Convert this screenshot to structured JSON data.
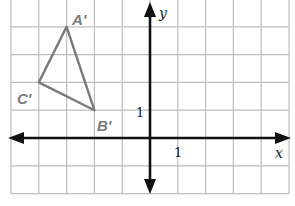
{
  "figure": {
    "type": "coordinate-grid",
    "grid": {
      "x_range": [
        -5,
        5
      ],
      "y_range": [
        -2,
        5
      ],
      "cell_px": 27.8,
      "origin_px": [
        150,
        138
      ],
      "grid_color": "#bdbdbd",
      "axis_color": "#111111"
    },
    "axes": {
      "x_label": "x",
      "y_label": "y",
      "x_tick_label": "1",
      "y_tick_label": "1"
    },
    "triangle": {
      "stroke_color": "#7a7a7a",
      "vertices": [
        {
          "name": "A'",
          "x": -3,
          "y": 4
        },
        {
          "name": "B'",
          "x": -2,
          "y": 1
        },
        {
          "name": "C'",
          "x": -4,
          "y": 2
        }
      ]
    }
  }
}
